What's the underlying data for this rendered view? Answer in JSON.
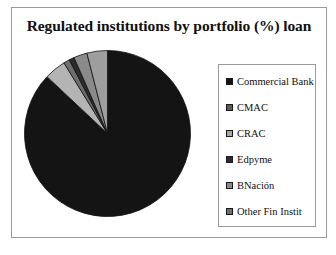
{
  "chart_data": {
    "type": "pie",
    "title": "Regulated institutions by portfolio (%) loan",
    "xlabel": "",
    "ylabel": "",
    "legend_position": "right",
    "grid": false,
    "start_angle_deg": 0,
    "direction": "clockwise",
    "categories": [
      "Commercial Bank",
      "CMAC",
      "CRAC",
      "Edpyme",
      "BNación",
      "Other Fin Instit"
    ],
    "values": [
      87.0,
      4.2,
      1.2,
      1.0,
      2.6,
      4.0
    ],
    "colors": [
      "#141414",
      "#b4b4b4",
      "#6e6e6e",
      "#2b2b2b",
      "#8a8a8a",
      "#9e9e9e"
    ],
    "slices": [
      {
        "label": "Commercial Bank",
        "value": 87.0,
        "color": "#141414"
      },
      {
        "label": "CMAC",
        "value": 4.2,
        "color": "#b4b4b4"
      },
      {
        "label": "CRAC",
        "value": 1.2,
        "color": "#6e6e6e"
      },
      {
        "label": "Edpyme",
        "value": 1.0,
        "color": "#2b2b2b"
      },
      {
        "label": "BNación",
        "value": 2.6,
        "color": "#8a8a8a"
      },
      {
        "label": "Other Fin Instit",
        "value": 4.0,
        "color": "#9e9e9e"
      }
    ]
  },
  "legend": {
    "items": [
      {
        "label": "Commercial Bank",
        "color": "#141414"
      },
      {
        "label": "CMAC",
        "color": "#5a5a5a"
      },
      {
        "label": "CRAC",
        "color": "#a8a8a8"
      },
      {
        "label": "Edpyme",
        "color": "#2b2b2b"
      },
      {
        "label": "BNación",
        "color": "#8a8a8a"
      },
      {
        "label": "Other Fin Instit",
        "color": "#6e6e6e"
      }
    ]
  }
}
